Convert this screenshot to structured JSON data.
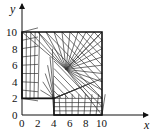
{
  "diagram": {
    "title": "",
    "type": "mesh-grid",
    "domain_description": "L-shaped region [0,10]x[0,10] minus rectangle [0,4]x[0,2]",
    "axes": {
      "x_label": "x",
      "y_label": "y",
      "x_ticks": [
        "0",
        "2",
        "4",
        "6",
        "8",
        "10"
      ],
      "y_ticks": [
        "0",
        "2",
        "4",
        "6",
        "8",
        "10"
      ],
      "x_range": [
        0,
        10
      ],
      "y_range": [
        0,
        10
      ]
    },
    "cutout": {
      "x0": 0,
      "y0": 0,
      "x1": 4,
      "y1": 2
    },
    "colors": {
      "line": "#111111",
      "mesh": "#333333",
      "background": "#ffffff"
    }
  }
}
